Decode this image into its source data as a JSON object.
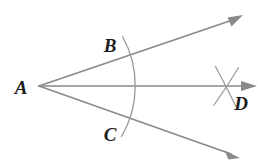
{
  "figure": {
    "background_color": "#ffffff",
    "line_color": "#8a8a8a",
    "arc_color": "#9a9a9a",
    "label_color": "#1c1c1c"
  },
  "labels": {
    "vertex_a": "A",
    "point_b": "B",
    "point_c": "C",
    "point_d": "D"
  },
  "label_positions": {
    "vertex_a": {
      "x": 21,
      "y": 94
    },
    "point_b": {
      "x": 110,
      "y": 52
    },
    "point_c": {
      "x": 110,
      "y": 141
    },
    "point_d": {
      "x": 241,
      "y": 110
    }
  },
  "geometry": {
    "vertex": {
      "x": 39,
      "y": 86
    },
    "rays": [
      {
        "name": "upper-ray",
        "from": {
          "x": 39,
          "y": 86
        },
        "to": {
          "x": 233,
          "y": 19
        },
        "arrow_tip": {
          "x": 242,
          "y": 16
        }
      },
      {
        "name": "bisector-ray",
        "from": {
          "x": 39,
          "y": 86
        },
        "to": {
          "x": 246,
          "y": 86
        },
        "arrow_tip": {
          "x": 256,
          "y": 86
        }
      },
      {
        "name": "lower-ray",
        "from": {
          "x": 39,
          "y": 86
        },
        "to": {
          "x": 230,
          "y": 154
        },
        "arrow_tip": {
          "x": 239,
          "y": 158
        }
      }
    ],
    "arc_bc": {
      "center": {
        "x": 39,
        "y": 86
      },
      "radius": 101,
      "start": {
        "x": 122,
        "y": 37
      },
      "end": {
        "x": 121,
        "y": 136
      }
    },
    "cross_marks": {
      "intersection": {
        "x": 228,
        "y": 86
      },
      "arc_one": {
        "start": {
          "x": 214,
          "y": 104
        },
        "end": {
          "x": 238,
          "y": 68
        }
      },
      "arc_two": {
        "start": {
          "x": 215,
          "y": 67
        },
        "end": {
          "x": 236,
          "y": 106
        }
      }
    }
  }
}
